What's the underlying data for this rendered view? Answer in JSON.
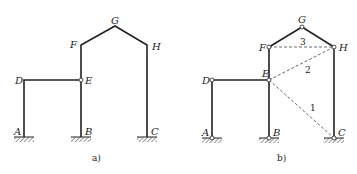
{
  "figure_a": {
    "caption": "a)",
    "nodes": {
      "A": {
        "label": "A"
      },
      "B": {
        "label": "B"
      },
      "C": {
        "label": "C"
      },
      "D": {
        "label": "D"
      },
      "E": {
        "label": "E"
      },
      "F": {
        "label": "F"
      },
      "G": {
        "label": "G"
      },
      "H": {
        "label": "H"
      }
    }
  },
  "figure_b": {
    "caption": "b)",
    "nodes": {
      "A": {
        "label": "A"
      },
      "B": {
        "label": "B"
      },
      "C": {
        "label": "C"
      },
      "D": {
        "label": "D"
      },
      "E": {
        "label": "E"
      },
      "F": {
        "label": "F"
      },
      "G": {
        "label": "G"
      },
      "H": {
        "label": "H"
      }
    },
    "links": [
      {
        "id": "1",
        "label": "1",
        "from": "E",
        "to": "C"
      },
      {
        "id": "2",
        "label": "2",
        "from": "E",
        "to": "H"
      },
      {
        "id": "3",
        "label": "3",
        "from": "F",
        "to": "H"
      }
    ]
  },
  "colors": {
    "line": "#222222",
    "dashed": "#444444",
    "background": "#ffffff"
  }
}
